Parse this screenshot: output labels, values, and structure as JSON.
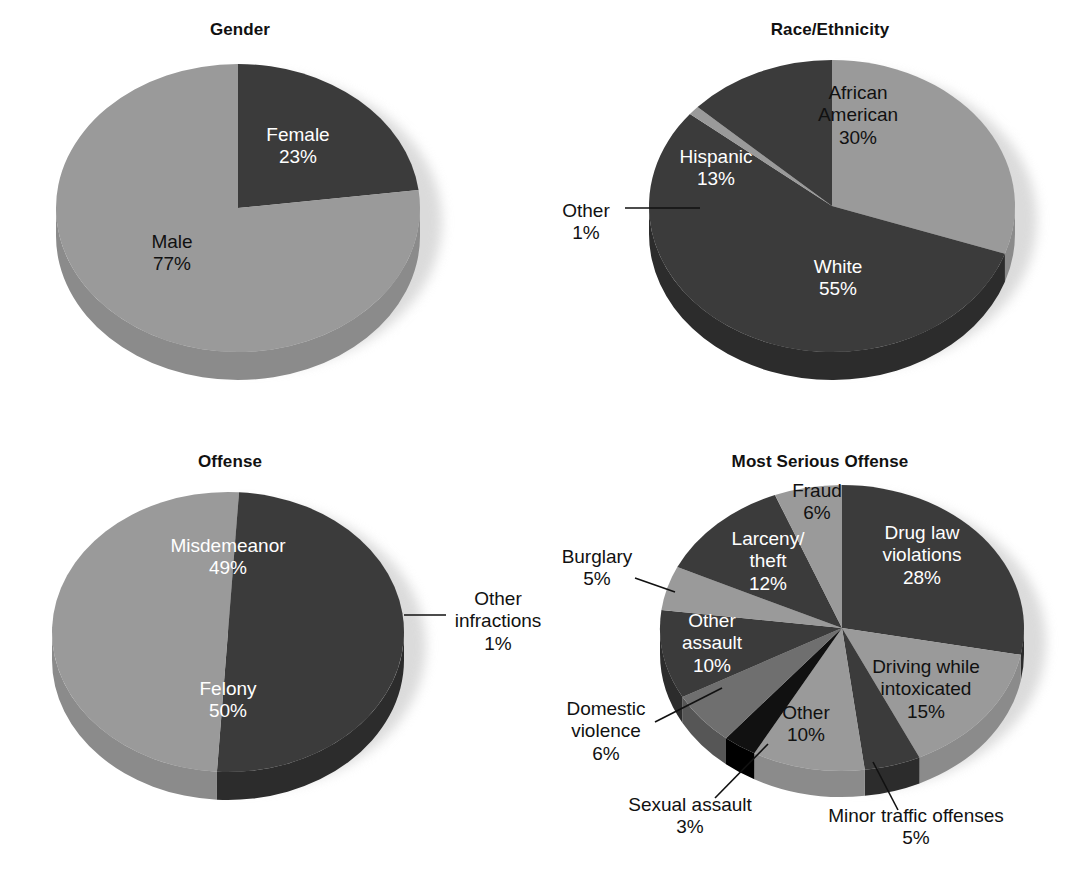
{
  "figure": {
    "background": "#ffffff",
    "palette": {
      "dark": "#3b3b3b",
      "light": "#9a9a9a",
      "mid": "#6f6f6f",
      "black": "#111111",
      "pale": "#b5b5b5",
      "side_dark": "#2c2c2c",
      "side_light": "#8b8b8b",
      "side_mid": "#565656",
      "shadow": "#cfcfcf"
    }
  },
  "charts": [
    {
      "id": "gender",
      "title": "Gender",
      "type": "pie",
      "title_x": 240,
      "title_y": 20,
      "cx": 238,
      "cy": 208,
      "rx": 182,
      "ry": 144,
      "depth": 28,
      "start_angle": 0,
      "chart_data": {
        "type": "pie",
        "title": "Gender",
        "categories": [
          "Female",
          "Male"
        ],
        "values": [
          23,
          77
        ],
        "unit": "%",
        "total": 100,
        "legend": "none",
        "labels_inside": true
      },
      "slices": [
        {
          "name": "Female",
          "value": 23,
          "pct_text": "23%",
          "tone": "dark",
          "label_pos": "inside",
          "label_color": "inside-light",
          "lx": 298,
          "ly": 146
        },
        {
          "name": "Male",
          "value": 77,
          "pct_text": "77%",
          "tone": "light",
          "label_pos": "inside",
          "label_color": "inside-dark",
          "lx": 172,
          "ly": 253
        }
      ],
      "leaders": []
    },
    {
      "id": "race_ethnicity",
      "title": "Race/Ethnicity",
      "type": "pie",
      "title_x": 830,
      "title_y": 20,
      "cx": 832,
      "cy": 206,
      "rx": 183,
      "ry": 146,
      "depth": 28,
      "start_angle": 0,
      "chart_data": {
        "type": "pie",
        "title": "Race/Ethnicity",
        "categories": [
          "African American",
          "White",
          "Other",
          "Hispanic"
        ],
        "values": [
          30,
          55,
          1,
          13
        ],
        "unit": "%",
        "total": 99,
        "legend": "none",
        "labels_inside": true
      },
      "slices": [
        {
          "name": "African American",
          "value": 30,
          "pct_text": "30%",
          "tone": "light",
          "label_pos": "inside",
          "label_color": "inside-dark",
          "lx": 858,
          "ly": 116
        },
        {
          "name": "White",
          "value": 55,
          "pct_text": "55%",
          "tone": "dark",
          "label_pos": "inside",
          "label_color": "inside-light",
          "lx": 838,
          "ly": 278
        },
        {
          "name": "Other",
          "value": 1,
          "pct_text": "1%",
          "tone": "light",
          "label_pos": "outside",
          "label_color": "outside",
          "lx": 586,
          "ly": 222
        },
        {
          "name": "Hispanic",
          "value": 13,
          "pct_text": "13%",
          "tone": "dark",
          "label_pos": "inside",
          "label_color": "inside-light",
          "lx": 716,
          "ly": 168
        }
      ],
      "leaders": [
        {
          "for": "Other",
          "x1": 625,
          "y1": 208,
          "x2": 700,
          "y2": 208
        }
      ]
    },
    {
      "id": "offense",
      "title": "Offense",
      "type": "pie",
      "title_x": 230,
      "title_y": 452,
      "cx": 228,
      "cy": 632,
      "rx": 176,
      "ry": 140,
      "depth": 28,
      "start_angle": 0,
      "chart_data": {
        "type": "pie",
        "title": "Offense",
        "categories": [
          "Other infractions",
          "Felony",
          "Misdemeanor"
        ],
        "values": [
          1,
          50,
          49
        ],
        "unit": "%",
        "total": 100,
        "legend": "none",
        "labels_inside": true
      },
      "slices": [
        {
          "name": "Other infractions",
          "value": 1,
          "pct_text": "1%",
          "tone": "light",
          "label_pos": "outside",
          "label_color": "outside",
          "lx": 498,
          "ly": 622
        },
        {
          "name": "Felony",
          "value": 50,
          "pct_text": "50%",
          "tone": "dark",
          "label_pos": "inside",
          "label_color": "inside-light",
          "lx": 228,
          "ly": 700
        },
        {
          "name": "Misdemeanor",
          "value": 49,
          "pct_text": "49%",
          "tone": "light",
          "label_pos": "inside",
          "label_color": "inside-light",
          "lx": 228,
          "ly": 557
        }
      ],
      "leaders": [
        {
          "for": "Other infractions",
          "x1": 404,
          "y1": 615,
          "x2": 446,
          "y2": 615
        }
      ]
    },
    {
      "id": "most_serious_offense",
      "title": "Most Serious Offense",
      "type": "pie",
      "title_x": 820,
      "title_y": 452,
      "cx": 842,
      "cy": 628,
      "rx": 182,
      "ry": 143,
      "depth": 26,
      "start_angle": 0,
      "chart_data": {
        "type": "pie",
        "title": "Most Serious Offense",
        "categories": [
          "Drug law violations",
          "Driving while intoxicated",
          "Minor traffic offenses",
          "Other",
          "Sexual assault",
          "Domestic violence",
          "Other assault",
          "Burglary",
          "Larceny/theft",
          "Fraud"
        ],
        "values": [
          28,
          15,
          5,
          10,
          3,
          6,
          10,
          5,
          12,
          6
        ],
        "unit": "%",
        "total": 100,
        "legend": "none",
        "labels_inside": false
      },
      "slices": [
        {
          "name": "Drug law violations",
          "value": 28,
          "pct_text": "28%",
          "tone": "dark",
          "label_pos": "inside",
          "label_color": "inside-light",
          "lx": 922,
          "ly": 556
        },
        {
          "name": "Driving while intoxicated",
          "value": 15,
          "pct_text": "15%",
          "tone": "light",
          "label_pos": "inside",
          "label_color": "inside-dark",
          "lx": 926,
          "ly": 690
        },
        {
          "name": "Minor traffic offenses",
          "value": 5,
          "pct_text": "5%",
          "tone": "dark",
          "label_pos": "outside",
          "label_color": "outside",
          "lx": 916,
          "ly": 827
        },
        {
          "name": "Other",
          "value": 10,
          "pct_text": "10%",
          "tone": "light",
          "label_pos": "inside",
          "label_color": "inside-dark",
          "lx": 806,
          "ly": 724
        },
        {
          "name": "Sexual assault",
          "value": 3,
          "pct_text": "3%",
          "tone": "black",
          "label_pos": "outside",
          "label_color": "outside",
          "lx": 690,
          "ly": 816
        },
        {
          "name": "Domestic violence",
          "value": 6,
          "pct_text": "6%",
          "tone": "mid",
          "label_pos": "outside",
          "label_color": "outside",
          "lx": 606,
          "ly": 732
        },
        {
          "name": "Other assault",
          "value": 10,
          "pct_text": "10%",
          "tone": "dark",
          "label_pos": "inside",
          "label_color": "inside-light",
          "lx": 712,
          "ly": 644
        },
        {
          "name": "Burglary",
          "value": 5,
          "pct_text": "5%",
          "tone": "light",
          "label_pos": "outside",
          "label_color": "outside",
          "lx": 597,
          "ly": 568
        },
        {
          "name": "Larceny/theft",
          "value": 12,
          "pct_text": "12%",
          "tone": "dark",
          "label_pos": "inside",
          "label_color": "inside-light",
          "lx": 768,
          "ly": 562
        },
        {
          "name": "Fraud",
          "value": 6,
          "pct_text": "6%",
          "tone": "light",
          "label_pos": "inside",
          "label_color": "inside-dark",
          "lx": 817,
          "ly": 502
        }
      ],
      "leaders": [
        {
          "for": "Minor traffic offenses",
          "x1": 898,
          "y1": 810,
          "x2": 873,
          "y2": 762
        },
        {
          "for": "Sexual assault",
          "x1": 715,
          "y1": 798,
          "x2": 768,
          "y2": 744
        },
        {
          "for": "Domestic violence",
          "x1": 655,
          "y1": 722,
          "x2": 722,
          "y2": 688
        },
        {
          "for": "Burglary",
          "x1": 635,
          "y1": 578,
          "x2": 675,
          "y2": 592
        }
      ]
    }
  ]
}
